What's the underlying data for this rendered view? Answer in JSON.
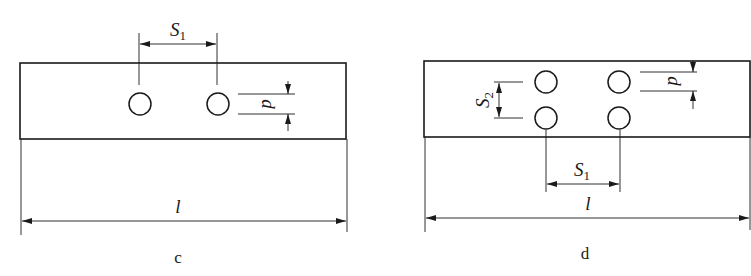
{
  "figures": [
    {
      "caption": "c",
      "labels": {
        "hole_spacing": "S",
        "hole_spacing_sub": "1",
        "diameter": "d",
        "length": "l"
      },
      "hole_count": 2,
      "layout": "single row"
    },
    {
      "caption": "d",
      "labels": {
        "row_spacing": "S",
        "row_spacing_sub": "2",
        "hole_spacing": "S",
        "hole_spacing_sub": "1",
        "diameter": "d",
        "length": "l"
      },
      "hole_count": 4,
      "layout": "two rows"
    }
  ]
}
